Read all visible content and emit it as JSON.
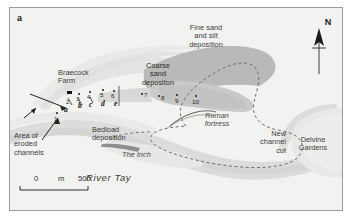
{
  "figure": {
    "panel_letter": "a",
    "background_color": "#f2f2f0",
    "frame_color": "#9a9a96"
  },
  "legend_colors": {
    "fine_sand_silt": "#b9b9b7",
    "coarse_sand": "#cfcfcd",
    "river_water": "#dcdcda",
    "land": "#f2f2f0",
    "bedload_bar": "#8e8e8c",
    "fortress_outline": "#6e6e6a"
  },
  "labels": {
    "fine_sand_deposition": "Fine sand\nand silt\ndeposition",
    "coarse_sand_deposition": "Coarse\nsand\ndepositon",
    "braecock_farm": "Braecock\nFarm",
    "roman_fortress": "Roman\nfortress",
    "new_channel_cut": "New\nchannel\ncut",
    "delvine_gardens": "Delvine\nGardens",
    "bedload_deposition": "Bedload\ndeposition",
    "the_inch": "The Inch",
    "river_tay": "River Tay",
    "area_of_eroded_channels": "Area of\neroded\nchannels"
  },
  "north_arrow": {
    "letter": "N",
    "name": "north-arrow"
  },
  "scale_bar": {
    "zero": "0",
    "unit": "m",
    "max": "500"
  },
  "sites": {
    "numbered": [
      {
        "id": "1",
        "x": 46,
        "y": 110
      },
      {
        "id": "2",
        "x": 58,
        "y": 96
      },
      {
        "id": "3",
        "x": 68,
        "y": 90
      },
      {
        "id": "4",
        "x": 79,
        "y": 88
      },
      {
        "id": "5",
        "x": 92,
        "y": 86
      },
      {
        "id": "6",
        "x": 103,
        "y": 87
      },
      {
        "id": "7",
        "x": 139,
        "y": 91
      },
      {
        "id": "8",
        "x": 156,
        "y": 93
      },
      {
        "id": "9",
        "x": 172,
        "y": 94
      },
      {
        "id": "10",
        "x": 190,
        "y": 95
      }
    ],
    "lettered": [
      {
        "id": "a",
        "x": 56,
        "y": 105
      },
      {
        "id": "b",
        "x": 70,
        "y": 101
      },
      {
        "id": "c",
        "x": 81,
        "y": 100
      },
      {
        "id": "d",
        "x": 93,
        "y": 99
      },
      {
        "id": "e",
        "x": 105,
        "y": 99
      }
    ],
    "farm_marker": {
      "x": 60,
      "y": 85
    }
  }
}
